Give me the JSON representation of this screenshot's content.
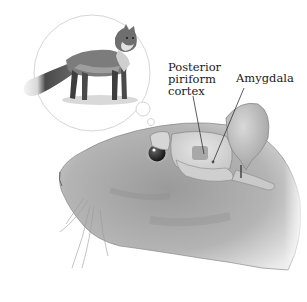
{
  "figure": {
    "thought_bubble": {
      "subject": "fox",
      "description": "Red fox standing, viewed from the side, inside a circular thought bubble"
    },
    "subject_animal": "rat",
    "labels": [
      {
        "id": "posterior-piriform-cortex",
        "text": "Posterior\npiriform\ncortex"
      },
      {
        "id": "amygdala",
        "text": "Amygdala"
      }
    ],
    "colors": {
      "background": "#ffffff",
      "fur_light": "#bdbdbd",
      "fur_dark": "#8a8a8a",
      "brain": "#d8d8d8",
      "brain_highlight": "#a9a9a9",
      "outline": "#5a5a5a",
      "bubble_stroke": "#d6d6d6"
    }
  }
}
